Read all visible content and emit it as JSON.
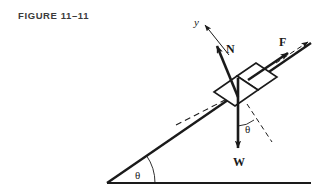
{
  "figure": {
    "caption": "FIGURE 11–11",
    "background_color": "#ffffff",
    "ink_color": "#1a1a1a",
    "caption_color": "#3b3b3b"
  },
  "labels": {
    "y_axis": "y",
    "normal_force": "N",
    "applied_force": "F",
    "weight": "W",
    "incline_angle": "θ",
    "weight_angle": "θ"
  },
  "diagram": {
    "type": "free-body-diagram-on-inclined-plane",
    "ground_line": {
      "x1": 107,
      "y1": 183,
      "x2": 311,
      "y2": 183
    },
    "incline_line": {
      "x1": 107,
      "y1": 183,
      "x2": 311,
      "y2": 43
    },
    "incline_angle_deg": 34,
    "block": {
      "shape": "parallelepiped",
      "front_face": [
        [
          214,
          92
        ],
        [
          237,
          76
        ],
        [
          258,
          90
        ],
        [
          235,
          106
        ]
      ],
      "top_face": [
        [
          237,
          76
        ],
        [
          256,
          63
        ],
        [
          277,
          77
        ],
        [
          258,
          90
        ]
      ]
    },
    "vectors": [
      {
        "name": "normal-force-vector",
        "label": "N",
        "style": "solid-bold",
        "x1": 236,
        "y1": 95,
        "x2": 216,
        "y2": 43,
        "label_x": 232,
        "label_y": 50
      },
      {
        "name": "y-axis-vector",
        "label": "y",
        "style": "solid-thin",
        "x1": 228,
        "y1": 54,
        "x2": 204,
        "y2": 23,
        "label_x": 196,
        "label_y": 22
      },
      {
        "name": "applied-force-vector",
        "label": "F",
        "style": "solid-bold",
        "x1": 249,
        "y1": 79,
        "x2": 290,
        "y2": 51,
        "label_x": 284,
        "label_y": 45
      },
      {
        "name": "x-axis-dashed-vector",
        "label": "",
        "style": "dashed-thin",
        "x1": 278,
        "y1": 62,
        "x2": 310,
        "y2": 42
      },
      {
        "name": "weight-vector",
        "label": "W",
        "style": "solid-bold",
        "x1": 238,
        "y1": 96,
        "x2": 238,
        "y2": 150,
        "label_x": 240,
        "label_y": 164
      }
    ],
    "dashed_lines": [
      {
        "name": "incline-parallel-dashed",
        "x1": 178,
        "y1": 124,
        "x2": 228,
        "y2": 98
      },
      {
        "name": "weight-angle-dashed",
        "x1": 248,
        "y1": 105,
        "x2": 273,
        "y2": 143
      }
    ],
    "angle_arcs": [
      {
        "name": "incline-angle-arc",
        "cx": 107,
        "cy": 183,
        "radius": 48,
        "label_x": 139,
        "label_y": 177
      },
      {
        "name": "weight-angle-arc",
        "cx": 239,
        "cy": 99,
        "radius": 26,
        "label_x": 247,
        "label_y": 132
      }
    ]
  }
}
